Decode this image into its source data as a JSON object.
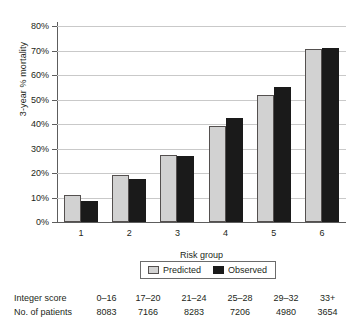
{
  "chart_data": {
    "type": "bar",
    "title": "",
    "xlabel": "Risk group",
    "ylabel": "3-year % mortality",
    "categories": [
      "1",
      "2",
      "3",
      "4",
      "5",
      "6"
    ],
    "ylim": [
      0,
      80
    ],
    "ytick_labels": [
      "0%",
      "10%",
      "20%",
      "30%",
      "40%",
      "50%",
      "60%",
      "70%",
      "80%"
    ],
    "ytick_values": [
      0,
      10,
      20,
      30,
      40,
      50,
      60,
      70,
      80
    ],
    "grid": true,
    "legend_position": "below-axis-center",
    "series": [
      {
        "name": "Predicted",
        "color": "#d2d2d2",
        "values": [
          11,
          19,
          27.5,
          39,
          52,
          70.5
        ]
      },
      {
        "name": "Observed",
        "color": "#1a1a1a",
        "values": [
          8.5,
          17.5,
          27,
          42.5,
          55,
          71
        ]
      }
    ]
  },
  "legend": {
    "items": [
      {
        "label": "Predicted",
        "swatch": "predicted"
      },
      {
        "label": "Observed",
        "swatch": "observed"
      }
    ]
  },
  "table": {
    "rows": [
      {
        "header": "Integer score",
        "values": [
          "0–16",
          "17–20",
          "21–24",
          "25–28",
          "29–32",
          "33+"
        ]
      },
      {
        "header": "No. of patients",
        "values": [
          "8083",
          "7166",
          "8283",
          "7206",
          "4980",
          "3654"
        ]
      }
    ]
  }
}
